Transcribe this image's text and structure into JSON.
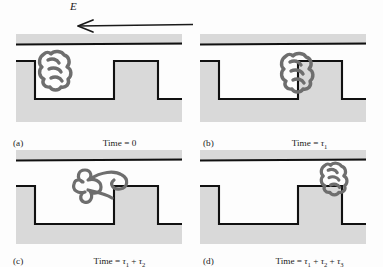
{
  "figure": {
    "field": {
      "label": "E",
      "arrow_direction": "left",
      "arrow_name": "electric-field-arrow"
    },
    "colors": {
      "wall_fill": "#d9d9d9",
      "wall_outline": "#111111",
      "polymer": "#6e6e6e",
      "background": "#fdfdfd",
      "text": "#1a1a1a"
    },
    "panels": [
      {
        "id": "a",
        "letter": "(a)",
        "time_prefix": "Time = ",
        "time_value": "0",
        "time_terms": [],
        "polymer_state": "compact coil resting on upper shoulder at left step edge",
        "polymer_x": 46,
        "polymer_y": 40
      },
      {
        "id": "b",
        "letter": "(b)",
        "time_prefix": "Time = ",
        "time_value": "",
        "time_terms": [
          "1"
        ],
        "polymer_state": "compact coil pressed against left face of right block",
        "polymer_x": 112,
        "polymer_y": 40
      },
      {
        "id": "c",
        "letter": "(c)",
        "time_prefix": "Time = ",
        "time_value": "",
        "time_terms": [
          "1",
          "2"
        ],
        "polymer_state": "partially uncoiled chain extending over the right block",
        "polymer_x": 96,
        "polymer_y": 20
      },
      {
        "id": "d",
        "letter": "(d)",
        "time_prefix": "Time = ",
        "time_value": "",
        "time_terms": [
          "1",
          "2",
          "3"
        ],
        "polymer_state": "recoiled compact coil in the thin slit above the right block",
        "polymer_x": 150,
        "polymer_y": 14
      }
    ]
  }
}
